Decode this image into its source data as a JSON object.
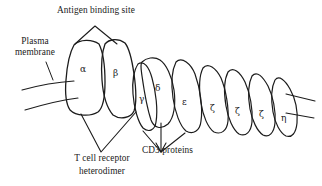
{
  "figure": {
    "background_color": "#ffffff",
    "stroke_color": "#1c1c1c",
    "text_color": "#1a1a1a"
  },
  "labels": {
    "antigen_binding_site": "Antigen binding site",
    "plasma_membrane_line1": "Plasma",
    "plasma_membrane_line2": "membrane",
    "tcr_line1": "T cell receptor",
    "tcr_line2": "heterodimer",
    "cd3_proteins": "CD3 proteins"
  },
  "subunits": [
    {
      "id": "alpha",
      "symbol": "α",
      "name": "alpha"
    },
    {
      "id": "beta",
      "symbol": "β",
      "name": "beta"
    },
    {
      "id": "gamma",
      "symbol": "γ",
      "name": "gamma"
    },
    {
      "id": "delta",
      "symbol": "δ",
      "name": "delta"
    },
    {
      "id": "epsilon",
      "symbol": "ε",
      "name": "epsilon"
    },
    {
      "id": "zeta1",
      "symbol": "ζ",
      "name": "zeta"
    },
    {
      "id": "zeta2",
      "symbol": "ζ",
      "name": "zeta"
    },
    {
      "id": "zeta3",
      "symbol": "ζ",
      "name": "zeta"
    },
    {
      "id": "eta",
      "symbol": "η",
      "name": "eta"
    }
  ]
}
